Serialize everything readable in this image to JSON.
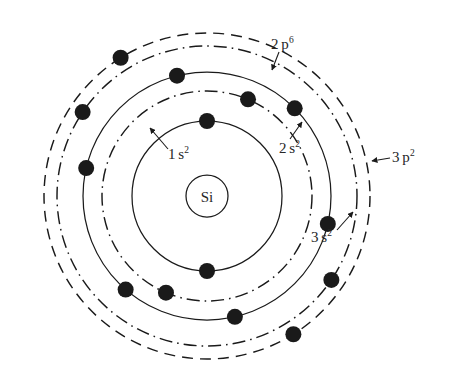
{
  "figure": {
    "type": "bohr-atom-diagram",
    "element_symbol": "Si",
    "element_name": "Silicon",
    "center": {
      "x": 207,
      "y": 196
    },
    "nucleus": {
      "label": "Si",
      "radius": 21
    },
    "ink_color": "#1a1a1a",
    "background_color": "#ffffff",
    "shells": [
      {
        "id": "1s2",
        "label_base": "1",
        "label_orbital": "s",
        "label_exponent": "2",
        "radius": 75,
        "style": "solid",
        "electron_count": 2,
        "electron_angles_deg": [
          270,
          90
        ]
      },
      {
        "id": "2s2",
        "label_base": "2",
        "label_orbital": "s",
        "label_exponent": "2",
        "radius": 105,
        "style": "dash-dot",
        "electron_count": 2,
        "electron_angles_deg": [
          293,
          113
        ]
      },
      {
        "id": "2p6",
        "label_base": "2",
        "label_orbital": "p",
        "label_exponent": "6",
        "radius": 124,
        "style": "solid",
        "electron_count": 6,
        "electron_angles_deg": [
          256,
          315,
          13,
          77,
          131,
          193
        ]
      },
      {
        "id": "3s2",
        "label_base": "3",
        "label_orbital": "s",
        "label_exponent": "2",
        "radius": 150,
        "style": "dash-dot",
        "electron_count": 2,
        "electron_angles_deg": [
          214,
          34
        ]
      },
      {
        "id": "3p2",
        "label_base": "3",
        "label_orbital": "p",
        "label_exponent": "2",
        "radius": 163,
        "style": "dashed",
        "electron_count": 2,
        "electron_angles_deg": [
          238,
          58
        ]
      }
    ],
    "electron_dot_radius": 8,
    "labels": [
      {
        "id": "1s2",
        "text_base": "1",
        "text_orbital": "s",
        "text_exponent": "2",
        "x": 168,
        "y": 146,
        "leader": {
          "x1": 168,
          "y1": 149,
          "x2": 150,
          "y2": 128
        }
      },
      {
        "id": "2s2",
        "text_base": "2",
        "text_orbital": "s",
        "text_exponent": "2",
        "x": 279,
        "y": 140,
        "leader": {
          "x1": 290,
          "y1": 139,
          "x2": 302,
          "y2": 122
        }
      },
      {
        "id": "2p6",
        "text_base": "2",
        "text_orbital": "p",
        "text_exponent": "6",
        "x": 271,
        "y": 36,
        "leader": {
          "x1": 279,
          "y1": 52,
          "x2": 272,
          "y2": 70
        }
      },
      {
        "id": "3s2",
        "text_base": "3",
        "text_orbital": "s",
        "text_exponent": "2",
        "x": 311,
        "y": 229,
        "leader": {
          "x1": 337,
          "y1": 230,
          "x2": 353,
          "y2": 212
        }
      },
      {
        "id": "3p2",
        "text_base": "3",
        "text_orbital": "p",
        "text_exponent": "2",
        "x": 392,
        "y": 149,
        "leader": {
          "x1": 390,
          "y1": 158,
          "x2": 372,
          "y2": 161
        }
      }
    ],
    "caption": ""
  }
}
